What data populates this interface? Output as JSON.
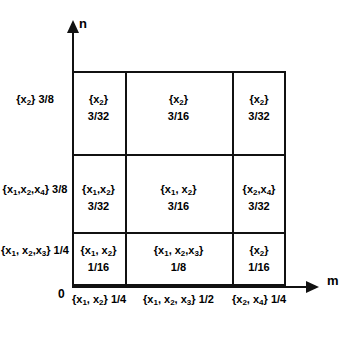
{
  "figure": {
    "axes": {
      "y_label": "n",
      "x_label": "m",
      "origin_label": "0"
    },
    "side_labels": [
      {
        "set": "{x2}",
        "value": "3/8"
      },
      {
        "set": "{x1,x2,x4}",
        "value": "3/8"
      },
      {
        "set": "{x1, x2,x3}",
        "value": "1/4"
      }
    ],
    "bottom_labels": [
      {
        "set": "{x1, x2}",
        "value": "1/4"
      },
      {
        "set": "{x1, x2, x3}",
        "value": "1/2"
      },
      {
        "set": "{x2, x4}",
        "value": "1/4"
      }
    ],
    "grid": {
      "rows": [
        {
          "name": "top-row",
          "cells": [
            {
              "set": "{x2}",
              "value": "3/32"
            },
            {
              "set": "{x2}",
              "value": "3/16"
            },
            {
              "set": "{x2}",
              "value": "3/32"
            }
          ]
        },
        {
          "name": "middle-row",
          "cells": [
            {
              "set": "{x1,x2}",
              "value": "3/32"
            },
            {
              "set": "{x1, x2}",
              "value": "3/16"
            },
            {
              "set": "{x2,x4}",
              "value": "3/32"
            }
          ]
        },
        {
          "name": "bottom-row",
          "cells": [
            {
              "set": "{x1, x2}",
              "value": "1/16"
            },
            {
              "set": "{x1, x2,x3}",
              "value": "1/8"
            },
            {
              "set": "{x2}",
              "value": "1/16"
            }
          ]
        }
      ]
    },
    "colors": {
      "ink": "#111111",
      "background": "#ffffff"
    }
  }
}
